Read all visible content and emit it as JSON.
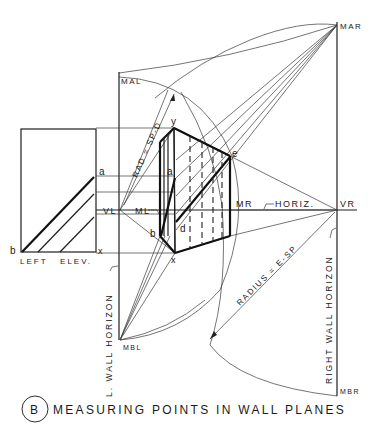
{
  "figure": {
    "caption_letter": "B",
    "caption": "MEASURING POINTS IN WALL PLANES"
  },
  "labels": {
    "mal": "MAL",
    "mar": "MAR",
    "mbl": "MBL",
    "mbr": "MBR",
    "vl": "VL",
    "vr": "VR",
    "ml": "ML",
    "mr": "MR",
    "horiz": "HORIZ.",
    "rad_sp_d": "RAD = SP-D",
    "radius_e_sp": "RADIUS = E-SP",
    "left_wall_horizon": "L. WALL HORIZON",
    "right_wall_horizon": "RIGHT WALL HORIZON",
    "left_elev": "LEFT   ELEV.",
    "point_a_elev": "a",
    "point_b_elev": "b",
    "point_x_elev": "x",
    "point_y": "y",
    "point_a": "a",
    "point_b": "b",
    "point_d": "d",
    "point_e": "e",
    "point_x": "x"
  },
  "colors": {
    "ink": "#1a1a1a",
    "paper": "#ffffff"
  }
}
